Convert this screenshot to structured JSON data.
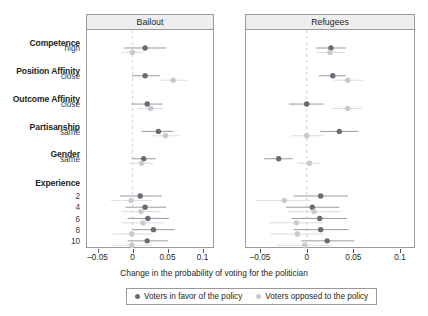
{
  "figure": {
    "xlabel": "Change in the probability of voting for the politician"
  },
  "colors": {
    "favor": "#6b6b76",
    "opposed": "#c9c9cf",
    "whisker_favor": "#9a9aa2",
    "whisker_opposed": "#dcdce1",
    "zero_line": "#dadada",
    "panel_border": "#9a9a9a",
    "strip_bg": "#eeeeee",
    "text": "#231f20"
  },
  "rows": [
    {
      "group": "Competence",
      "sub": "high"
    },
    {
      "group": "Position Affinity",
      "sub": "close"
    },
    {
      "group": "Outcome Affinity",
      "sub": "close"
    },
    {
      "group": "Partisanship",
      "sub": "same"
    },
    {
      "group": "Gender",
      "sub": "same"
    },
    {
      "group": "Experience",
      "sub": ""
    },
    {
      "group": "",
      "sub": "2"
    },
    {
      "group": "",
      "sub": "4"
    },
    {
      "group": "",
      "sub": "6"
    },
    {
      "group": "",
      "sub": "8"
    },
    {
      "group": "",
      "sub": "10"
    }
  ],
  "axis": {
    "ticks": [
      {
        "value": -0.05,
        "label": "–0.05"
      },
      {
        "value": 0,
        "label": "0"
      },
      {
        "value": 0.05,
        "label": "0.05"
      },
      {
        "value": 0.1,
        "label": "0.1"
      }
    ],
    "xlim": [
      -0.065,
      0.115
    ]
  },
  "legend": {
    "entries": [
      {
        "label": "Voters in favor of the policy",
        "color": "#6b6b76"
      },
      {
        "label": "Voters opposed to the policy",
        "color": "#c9c9cf"
      }
    ]
  },
  "chart_data": {
    "type": "scatter",
    "title": "",
    "subtitle": "",
    "xlabel": "Change in the probability of voting for the politician",
    "ylabel": "",
    "xlim": [
      -0.065,
      0.115
    ],
    "grid": false,
    "zero_reference_line": 0,
    "legend_position": "bottom",
    "orientation": "horizontal-dot-whisker",
    "categories": [
      "Competence: high",
      "Position Affinity: close",
      "Outcome Affinity: close",
      "Partisanship: same",
      "Gender: same",
      "Experience: 2",
      "Experience: 4",
      "Experience: 6",
      "Experience: 8",
      "Experience: 10"
    ],
    "panels": [
      {
        "name": "Bailout",
        "xlim": [
          -0.065,
          0.115
        ],
        "ticks": [
          -0.05,
          0,
          0.05,
          0.1
        ],
        "series": [
          {
            "name": "Voters in favor of the policy",
            "color": "#6b6b76",
            "points": [
              {
                "category": "Competence: high",
                "estimate": 0.018,
                "ci_low": -0.012,
                "ci_high": 0.048
              },
              {
                "category": "Position Affinity: close",
                "estimate": 0.018,
                "ci_low": -0.001,
                "ci_high": 0.039
              },
              {
                "category": "Outcome Affinity: close",
                "estimate": 0.021,
                "ci_low": -0.001,
                "ci_high": 0.043
              },
              {
                "category": "Partisanship: same",
                "estimate": 0.037,
                "ci_low": 0.013,
                "ci_high": 0.058
              },
              {
                "category": "Gender: same",
                "estimate": 0.016,
                "ci_low": -0.001,
                "ci_high": 0.033
              },
              {
                "category": "Experience: 2",
                "estimate": 0.011,
                "ci_low": -0.018,
                "ci_high": 0.042
              },
              {
                "category": "Experience: 4",
                "estimate": 0.018,
                "ci_low": -0.01,
                "ci_high": 0.048
              },
              {
                "category": "Experience: 6",
                "estimate": 0.022,
                "ci_low": -0.007,
                "ci_high": 0.052
              },
              {
                "category": "Experience: 8",
                "estimate": 0.03,
                "ci_low": 0.0,
                "ci_high": 0.06
              },
              {
                "category": "Experience: 10",
                "estimate": 0.021,
                "ci_low": -0.007,
                "ci_high": 0.051
              }
            ]
          },
          {
            "name": "Voters opposed to the policy",
            "color": "#c9c9cf",
            "points": [
              {
                "category": "Competence: high",
                "estimate": 0.0,
                "ci_low": -0.016,
                "ci_high": 0.016
              },
              {
                "category": "Position Affinity: close",
                "estimate": 0.058,
                "ci_low": 0.04,
                "ci_high": 0.078
              },
              {
                "category": "Outcome Affinity: close",
                "estimate": 0.026,
                "ci_low": 0.008,
                "ci_high": 0.044
              },
              {
                "category": "Partisanship: same",
                "estimate": 0.047,
                "ci_low": 0.028,
                "ci_high": 0.066
              },
              {
                "category": "Gender: same",
                "estimate": 0.013,
                "ci_low": -0.004,
                "ci_high": 0.03
              },
              {
                "category": "Experience: 2",
                "estimate": -0.002,
                "ci_low": -0.031,
                "ci_high": 0.027
              },
              {
                "category": "Experience: 4",
                "estimate": 0.012,
                "ci_low": -0.016,
                "ci_high": 0.041
              },
              {
                "category": "Experience: 6",
                "estimate": 0.015,
                "ci_low": -0.014,
                "ci_high": 0.044
              },
              {
                "category": "Experience: 8",
                "estimate": -0.001,
                "ci_low": -0.029,
                "ci_high": 0.028
              },
              {
                "category": "Experience: 10",
                "estimate": -0.001,
                "ci_low": -0.03,
                "ci_high": 0.028
              }
            ]
          }
        ]
      },
      {
        "name": "Refugees",
        "xlim": [
          -0.065,
          0.115
        ],
        "ticks": [
          -0.05,
          0,
          0.05,
          0.1
        ],
        "series": [
          {
            "name": "Voters in favor of the policy",
            "color": "#6b6b76",
            "points": [
              {
                "category": "Competence: high",
                "estimate": 0.026,
                "ci_low": 0.01,
                "ci_high": 0.042
              },
              {
                "category": "Position Affinity: close",
                "estimate": 0.028,
                "ci_low": 0.013,
                "ci_high": 0.042
              },
              {
                "category": "Outcome Affinity: close",
                "estimate": 0.0,
                "ci_low": -0.019,
                "ci_high": 0.018
              },
              {
                "category": "Partisanship: same",
                "estimate": 0.035,
                "ci_low": 0.014,
                "ci_high": 0.055
              },
              {
                "category": "Gender: same",
                "estimate": -0.03,
                "ci_low": -0.046,
                "ci_high": -0.015
              },
              {
                "category": "Experience: 2",
                "estimate": 0.015,
                "ci_low": -0.014,
                "ci_high": 0.044
              },
              {
                "category": "Experience: 4",
                "estimate": 0.006,
                "ci_low": -0.022,
                "ci_high": 0.035
              },
              {
                "category": "Experience: 6",
                "estimate": 0.014,
                "ci_low": -0.016,
                "ci_high": 0.043
              },
              {
                "category": "Experience: 8",
                "estimate": 0.015,
                "ci_low": -0.014,
                "ci_high": 0.045
              },
              {
                "category": "Experience: 10",
                "estimate": 0.022,
                "ci_low": -0.006,
                "ci_high": 0.051
              }
            ]
          },
          {
            "name": "Voters opposed to the policy",
            "color": "#c9c9cf",
            "points": [
              {
                "category": "Competence: high",
                "estimate": 0.025,
                "ci_low": 0.01,
                "ci_high": 0.041
              },
              {
                "category": "Position Affinity: close",
                "estimate": 0.044,
                "ci_low": 0.029,
                "ci_high": 0.06
              },
              {
                "category": "Outcome Affinity: close",
                "estimate": 0.044,
                "ci_low": 0.028,
                "ci_high": 0.059
              },
              {
                "category": "Partisanship: same",
                "estimate": 0.0,
                "ci_low": -0.017,
                "ci_high": 0.017
              },
              {
                "category": "Gender: same",
                "estimate": 0.003,
                "ci_low": -0.01,
                "ci_high": 0.015
              },
              {
                "category": "Experience: 2",
                "estimate": -0.024,
                "ci_low": -0.054,
                "ci_high": 0.005
              },
              {
                "category": "Experience: 4",
                "estimate": 0.008,
                "ci_low": -0.02,
                "ci_high": 0.037
              },
              {
                "category": "Experience: 6",
                "estimate": -0.011,
                "ci_low": -0.04,
                "ci_high": 0.018
              },
              {
                "category": "Experience: 8",
                "estimate": -0.01,
                "ci_low": -0.039,
                "ci_high": 0.019
              },
              {
                "category": "Experience: 10",
                "estimate": -0.002,
                "ci_low": -0.031,
                "ci_high": 0.027
              }
            ]
          }
        ]
      }
    ]
  }
}
